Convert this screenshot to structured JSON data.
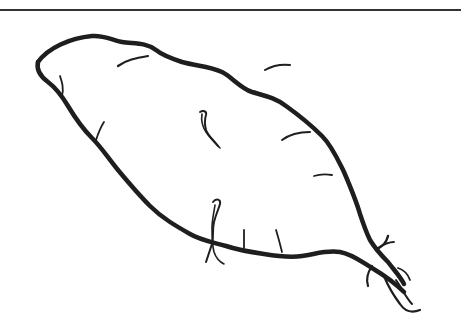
{
  "image": {
    "subject": "sweet potato line drawing",
    "background_color": "#ffffff",
    "ink_color": "#1e1e1e",
    "rule_color": "#333333",
    "elements": [
      {
        "name": "top-rule",
        "description": "horizontal dark line across top edge"
      },
      {
        "name": "tuber-outline",
        "description": "elongated tuber silhouette running diagonally from upper-left to lower-right"
      },
      {
        "name": "upper-sprout",
        "description": "small hooked sprout near top center"
      },
      {
        "name": "lower-sprout",
        "description": "small hooked sprout near bottom center"
      },
      {
        "name": "root-tendrils",
        "description": "branching thin roots at lower-right tip"
      }
    ]
  }
}
